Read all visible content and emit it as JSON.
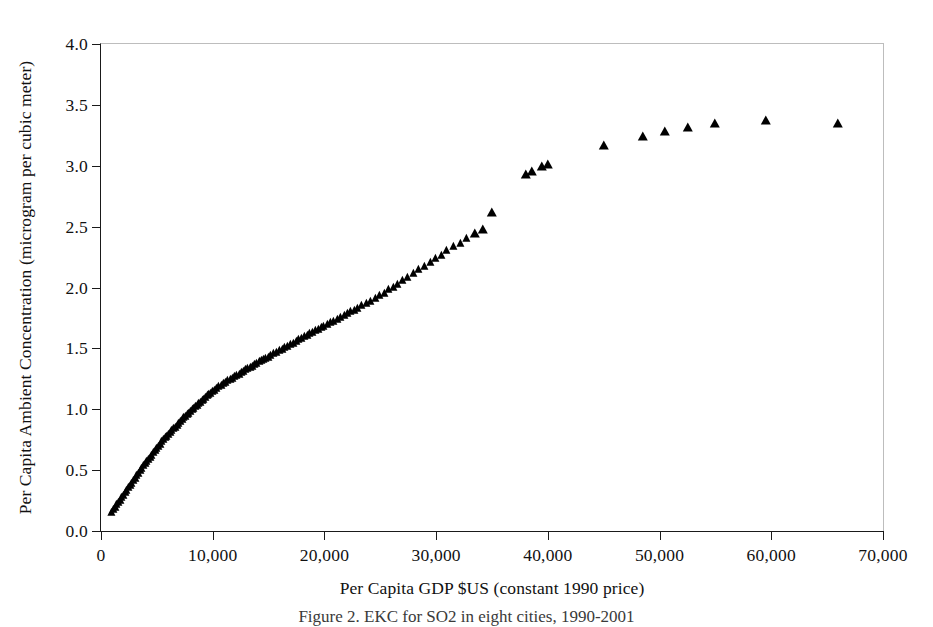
{
  "figure": {
    "caption": "Figure 2. EKC for SO2 in eight cities, 1990-2001"
  },
  "chart_data": {
    "type": "scatter",
    "title": "",
    "xlabel": "Per Capita GDP $US (constant 1990 price)",
    "ylabel": "Per Capita Ambient Concentration (microgram per cubic meter)",
    "xlim": [
      0,
      70000
    ],
    "ylim": [
      0,
      4.0
    ],
    "xticks": [
      0,
      10000,
      20000,
      30000,
      40000,
      50000,
      60000,
      70000
    ],
    "xtick_labels": [
      "0",
      "10,000",
      "20,000",
      "30,000",
      "40,000",
      "50,000",
      "60,000",
      "70,000"
    ],
    "yticks": [
      0.0,
      0.5,
      1.0,
      1.5,
      2.0,
      2.5,
      3.0,
      3.5,
      4.0
    ],
    "ytick_labels": [
      "0.0",
      "0.5",
      "1.0",
      "1.5",
      "2.0",
      "2.5",
      "3.0",
      "3.5",
      "4.0"
    ],
    "grid": false,
    "legend": null,
    "marker": "triangle",
    "marker_color": "#000000",
    "series": [
      {
        "name": "Per Capita Ambient Concentration vs Per Capita GDP",
        "points": [
          [
            1000,
            0.15
          ],
          [
            1150,
            0.17
          ],
          [
            1300,
            0.19
          ],
          [
            1450,
            0.21
          ],
          [
            1600,
            0.23
          ],
          [
            1750,
            0.25
          ],
          [
            1900,
            0.27
          ],
          [
            2050,
            0.29
          ],
          [
            2200,
            0.31
          ],
          [
            2350,
            0.33
          ],
          [
            2500,
            0.35
          ],
          [
            2650,
            0.37
          ],
          [
            2800,
            0.39
          ],
          [
            2950,
            0.41
          ],
          [
            3100,
            0.43
          ],
          [
            3250,
            0.45
          ],
          [
            3400,
            0.47
          ],
          [
            3550,
            0.49
          ],
          [
            3700,
            0.51
          ],
          [
            3850,
            0.53
          ],
          [
            4000,
            0.55
          ],
          [
            4150,
            0.57
          ],
          [
            4300,
            0.585
          ],
          [
            4450,
            0.6
          ],
          [
            4600,
            0.62
          ],
          [
            4750,
            0.64
          ],
          [
            4900,
            0.66
          ],
          [
            5050,
            0.675
          ],
          [
            5200,
            0.69
          ],
          [
            5350,
            0.71
          ],
          [
            5500,
            0.73
          ],
          [
            5650,
            0.745
          ],
          [
            5800,
            0.76
          ],
          [
            5950,
            0.775
          ],
          [
            6100,
            0.79
          ],
          [
            6250,
            0.805
          ],
          [
            6400,
            0.82
          ],
          [
            6550,
            0.835
          ],
          [
            6700,
            0.85
          ],
          [
            6850,
            0.865
          ],
          [
            7000,
            0.88
          ],
          [
            7150,
            0.895
          ],
          [
            7300,
            0.91
          ],
          [
            7450,
            0.925
          ],
          [
            7600,
            0.94
          ],
          [
            7750,
            0.95
          ],
          [
            7900,
            0.965
          ],
          [
            8050,
            0.98
          ],
          [
            8200,
            0.99
          ],
          [
            8350,
            1.005
          ],
          [
            8500,
            1.02
          ],
          [
            8650,
            1.03
          ],
          [
            8800,
            1.045
          ],
          [
            8950,
            1.055
          ],
          [
            9100,
            1.07
          ],
          [
            9250,
            1.08
          ],
          [
            9400,
            1.09
          ],
          [
            9550,
            1.105
          ],
          [
            9700,
            1.115
          ],
          [
            9850,
            1.125
          ],
          [
            10000,
            1.14
          ],
          [
            10200,
            1.15
          ],
          [
            10400,
            1.165
          ],
          [
            10600,
            1.18
          ],
          [
            10800,
            1.19
          ],
          [
            11000,
            1.205
          ],
          [
            11200,
            1.215
          ],
          [
            11400,
            1.23
          ],
          [
            11600,
            1.24
          ],
          [
            11800,
            1.25
          ],
          [
            12000,
            1.265
          ],
          [
            12200,
            1.275
          ],
          [
            12400,
            1.285
          ],
          [
            12600,
            1.3
          ],
          [
            12800,
            1.31
          ],
          [
            13000,
            1.32
          ],
          [
            13200,
            1.33
          ],
          [
            13400,
            1.34
          ],
          [
            13600,
            1.35
          ],
          [
            13800,
            1.36
          ],
          [
            14000,
            1.375
          ],
          [
            14200,
            1.385
          ],
          [
            14400,
            1.395
          ],
          [
            14600,
            1.405
          ],
          [
            14800,
            1.415
          ],
          [
            15000,
            1.425
          ],
          [
            15250,
            1.44
          ],
          [
            15500,
            1.45
          ],
          [
            15750,
            1.465
          ],
          [
            16000,
            1.475
          ],
          [
            16250,
            1.49
          ],
          [
            16500,
            1.5
          ],
          [
            16750,
            1.515
          ],
          [
            17000,
            1.525
          ],
          [
            17250,
            1.54
          ],
          [
            17500,
            1.55
          ],
          [
            17750,
            1.565
          ],
          [
            18000,
            1.575
          ],
          [
            18250,
            1.59
          ],
          [
            18500,
            1.6
          ],
          [
            18750,
            1.615
          ],
          [
            19000,
            1.625
          ],
          [
            19250,
            1.64
          ],
          [
            19500,
            1.65
          ],
          [
            19750,
            1.665
          ],
          [
            20000,
            1.675
          ],
          [
            20300,
            1.69
          ],
          [
            20600,
            1.705
          ],
          [
            20900,
            1.72
          ],
          [
            21200,
            1.735
          ],
          [
            21500,
            1.75
          ],
          [
            21800,
            1.765
          ],
          [
            22100,
            1.78
          ],
          [
            22400,
            1.795
          ],
          [
            22700,
            1.81
          ],
          [
            23000,
            1.825
          ],
          [
            23400,
            1.845
          ],
          [
            23800,
            1.865
          ],
          [
            24200,
            1.885
          ],
          [
            24600,
            1.905
          ],
          [
            25000,
            1.93
          ],
          [
            25400,
            1.95
          ],
          [
            25800,
            1.98
          ],
          [
            26200,
            2.0
          ],
          [
            26600,
            2.02
          ],
          [
            27000,
            2.05
          ],
          [
            27500,
            2.08
          ],
          [
            28000,
            2.11
          ],
          [
            28500,
            2.14
          ],
          [
            29000,
            2.17
          ],
          [
            29500,
            2.2
          ],
          [
            30000,
            2.23
          ],
          [
            30500,
            2.26
          ],
          [
            31000,
            2.3
          ],
          [
            31600,
            2.33
          ],
          [
            32200,
            2.36
          ],
          [
            32800,
            2.4
          ],
          [
            33500,
            2.44
          ],
          [
            34200,
            2.47
          ],
          [
            35000,
            2.61
          ],
          [
            38000,
            2.92
          ],
          [
            38600,
            2.95
          ],
          [
            39500,
            2.99
          ],
          [
            40000,
            3.01
          ],
          [
            45000,
            3.16
          ],
          [
            48500,
            3.24
          ],
          [
            50500,
            3.28
          ],
          [
            52500,
            3.31
          ],
          [
            55000,
            3.34
          ],
          [
            59500,
            3.37
          ],
          [
            66000,
            3.34
          ]
        ]
      }
    ]
  }
}
